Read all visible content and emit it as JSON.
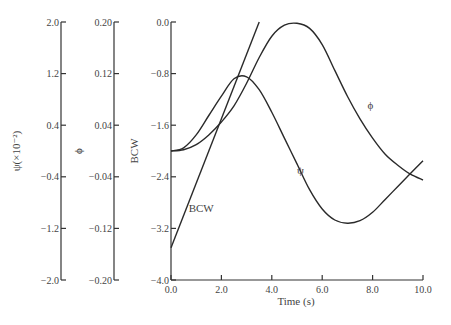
{
  "chart_data": {
    "type": "line",
    "title": "",
    "xlabel": "Time (s)",
    "xlim": [
      0,
      10
    ],
    "x_ticks": [
      "0.0",
      "2.0",
      "4.0",
      "6.0",
      "8.0",
      "10.0"
    ],
    "grid": false,
    "legend": "inline labels",
    "axes": [
      {
        "id": "psi",
        "label": "ψ(×10⁻²)",
        "ylim": [
          -2.0,
          2.0
        ],
        "ticks": [
          "2.0",
          "1.2",
          "0.4",
          "-0.4",
          "-1.2",
          "-2.0"
        ]
      },
      {
        "id": "phi",
        "label": "ϕ",
        "ylim": [
          -0.2,
          0.2
        ],
        "ticks": [
          "0.20",
          "0.12",
          "0.04",
          "-0.04",
          "-0.12",
          "-0.20"
        ]
      },
      {
        "id": "bcw",
        "label": "BCW",
        "ylim": [
          -4.0,
          0.0
        ],
        "ticks": [
          "0.0",
          "-0.8",
          "-1.6",
          "-2.4",
          "-3.2",
          "-4.0"
        ]
      }
    ],
    "plotted_in_units_of": "bcw",
    "x": [
      0,
      0.5,
      1.0,
      1.5,
      2.0,
      2.5,
      3.0,
      3.5,
      4.0,
      4.5,
      5.0,
      5.5,
      6.0,
      6.5,
      7.0,
      7.5,
      8.0,
      8.5,
      9.0,
      9.5,
      10.0
    ],
    "series": [
      {
        "name": "ψ",
        "label_pos": [
          5.0,
          -2.35
        ],
        "values": [
          -2.0,
          -1.95,
          -1.75,
          -1.45,
          -1.15,
          -0.88,
          -0.85,
          -1.05,
          -1.4,
          -1.8,
          -2.2,
          -2.6,
          -2.9,
          -3.07,
          -3.12,
          -3.08,
          -2.95,
          -2.75,
          -2.55,
          -2.35,
          -2.15
        ]
      },
      {
        "name": "ϕ",
        "label_pos": [
          7.8,
          -1.35
        ],
        "values": [
          -2.0,
          -1.98,
          -1.9,
          -1.75,
          -1.55,
          -1.3,
          -0.95,
          -0.55,
          -0.22,
          -0.05,
          -0.02,
          -0.1,
          -0.35,
          -0.75,
          -1.15,
          -1.5,
          -1.8,
          -2.05,
          -2.22,
          -2.36,
          -2.45
        ]
      },
      {
        "name": "BCW",
        "label_pos": [
          0.7,
          -2.95
        ],
        "x": [
          0,
          3.5
        ],
        "values": [
          -3.5,
          0.0
        ]
      }
    ]
  },
  "labels": {
    "xlabel": "Time (s)",
    "psi_axis_title": "ψ(×10⁻²)",
    "phi_axis_title": "ϕ",
    "bcw_axis_title": "BCW",
    "psi_curve": "ψ",
    "phi_curve": "ϕ",
    "bcw_curve": "BCW"
  }
}
